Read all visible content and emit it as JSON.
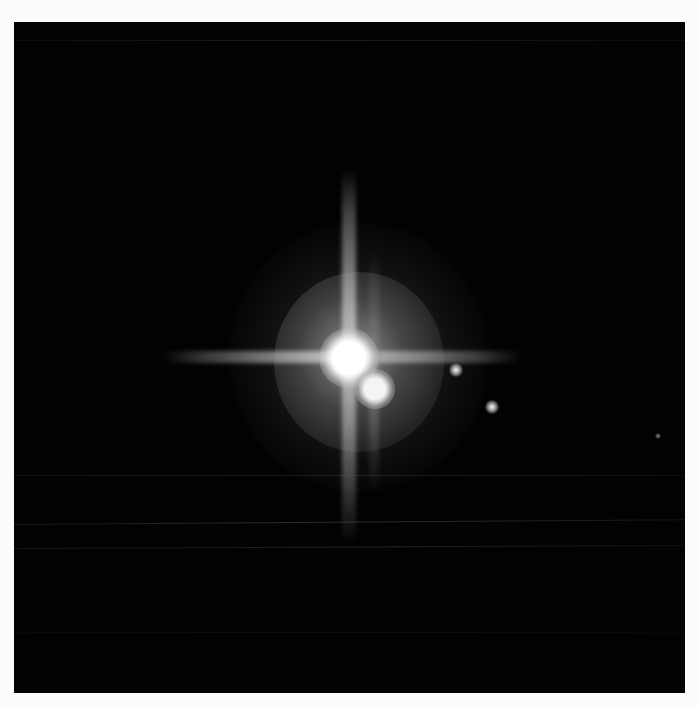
{
  "image": {
    "description": "Telescope image of a bright primary body with a close secondary companion and two small faint moons on a black background, with cross-shaped diffraction spikes",
    "background_color": "#020202",
    "border_color": "#fbfbfb"
  },
  "objects": [
    {
      "name": "primary-body",
      "label": "Primary (bright center)",
      "x": 349,
      "y": 358,
      "radius": 17
    },
    {
      "name": "secondary-body",
      "label": "Secondary companion",
      "x": 375,
      "y": 389,
      "radius": 12
    },
    {
      "name": "moon-a",
      "label": "Small moon",
      "x": 456,
      "y": 370
    },
    {
      "name": "moon-b",
      "label": "Small moon",
      "x": 492,
      "y": 407
    }
  ],
  "caption": {
    "text": ""
  }
}
